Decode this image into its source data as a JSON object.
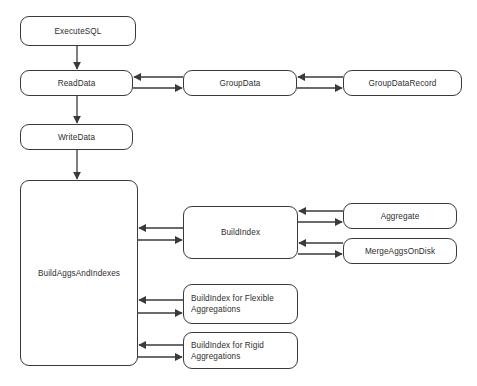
{
  "diagram": {
    "background_color": "#ffffff",
    "stroke_color": "#3a3a3a",
    "text_color": "#2e2e2e",
    "nodes": [
      {
        "id": "execute-sql",
        "label": "ExecuteSQL",
        "x": 20,
        "y": 16,
        "w": 116,
        "h": 30,
        "align": "center"
      },
      {
        "id": "read-data",
        "label": "ReadData",
        "x": 20,
        "y": 70,
        "w": 113,
        "h": 26,
        "align": "center"
      },
      {
        "id": "group-data",
        "label": "GroupData",
        "x": 183,
        "y": 70,
        "w": 114,
        "h": 26,
        "align": "center"
      },
      {
        "id": "group-data-record",
        "label": "GroupDataRecord",
        "x": 343,
        "y": 70,
        "w": 119,
        "h": 26,
        "align": "center"
      },
      {
        "id": "write-data",
        "label": "WriteData",
        "x": 20,
        "y": 124,
        "w": 113,
        "h": 26,
        "align": "center"
      },
      {
        "id": "build-aggs-and-indexes",
        "label": "BuildAggsAndIndexes",
        "x": 20,
        "y": 180,
        "w": 118,
        "h": 186,
        "align": "center"
      },
      {
        "id": "build-index",
        "label": "BuildIndex",
        "x": 183,
        "y": 206,
        "w": 115,
        "h": 53,
        "align": "center"
      },
      {
        "id": "aggregate",
        "label": "Aggregate",
        "x": 343,
        "y": 203,
        "w": 114,
        "h": 26,
        "align": "center"
      },
      {
        "id": "merge-aggs-on-disk",
        "label": "MergeAggsOnDisk",
        "x": 343,
        "y": 238,
        "w": 114,
        "h": 26,
        "align": "center"
      },
      {
        "id": "build-index-flexible",
        "label": "BuildIndex for Flexible\nAggregations",
        "x": 183,
        "y": 284,
        "w": 115,
        "h": 40,
        "align": "left"
      },
      {
        "id": "build-index-rigid",
        "label": "BuildIndex for Rigid\nAggregations",
        "x": 183,
        "y": 332,
        "w": 115,
        "h": 37,
        "align": "left"
      }
    ],
    "connectors": [
      {
        "id": "execute-sql-to-read-data",
        "kind": "vertical-arrow",
        "from": "execute-sql",
        "to": "read-data",
        "x": 77,
        "y1": 46,
        "y2": 70,
        "direction": "down"
      },
      {
        "id": "read-data-to-write-data",
        "kind": "vertical-arrow",
        "from": "read-data",
        "to": "write-data",
        "x": 77,
        "y1": 96,
        "y2": 124,
        "direction": "down"
      },
      {
        "id": "write-data-to-build-aggs",
        "kind": "vertical-arrow",
        "from": "write-data",
        "to": "build-aggs-and-indexes",
        "x": 77,
        "y1": 150,
        "y2": 180,
        "direction": "down"
      },
      {
        "id": "group-data-to-read-data",
        "kind": "horizontal-arrow",
        "from": "group-data",
        "to": "read-data",
        "x1": 183,
        "x2": 133,
        "y": 77,
        "direction": "left"
      },
      {
        "id": "read-data-to-group-data",
        "kind": "horizontal-arrow",
        "from": "read-data",
        "to": "group-data",
        "x1": 133,
        "x2": 183,
        "y": 88,
        "direction": "right"
      },
      {
        "id": "group-data-record-to-group-data",
        "kind": "horizontal-arrow",
        "from": "group-data-record",
        "to": "group-data",
        "x1": 343,
        "x2": 297,
        "y": 77,
        "direction": "left"
      },
      {
        "id": "group-data-to-group-data-record",
        "kind": "horizontal-arrow",
        "from": "group-data",
        "to": "group-data-record",
        "x1": 297,
        "x2": 343,
        "y": 88,
        "direction": "right"
      },
      {
        "id": "build-index-to-build-aggs",
        "kind": "horizontal-arrow",
        "from": "build-index",
        "to": "build-aggs-and-indexes",
        "x1": 183,
        "x2": 138,
        "y": 228,
        "direction": "left"
      },
      {
        "id": "build-aggs-to-build-index",
        "kind": "horizontal-arrow",
        "from": "build-aggs-and-indexes",
        "to": "build-index",
        "x1": 138,
        "x2": 183,
        "y": 240,
        "direction": "right"
      },
      {
        "id": "aggregate-to-build-index",
        "kind": "horizontal-arrow",
        "from": "aggregate",
        "to": "build-index",
        "x1": 343,
        "x2": 298,
        "y": 211,
        "direction": "left"
      },
      {
        "id": "build-index-to-aggregate",
        "kind": "horizontal-arrow",
        "from": "build-index",
        "to": "aggregate",
        "x1": 298,
        "x2": 343,
        "y": 222,
        "direction": "right"
      },
      {
        "id": "merge-aggs-to-build-index",
        "kind": "horizontal-arrow",
        "from": "merge-aggs-on-disk",
        "to": "build-index",
        "x1": 343,
        "x2": 298,
        "y": 243,
        "direction": "left"
      },
      {
        "id": "build-index-to-merge-aggs",
        "kind": "horizontal-arrow",
        "from": "build-index",
        "to": "merge-aggs-on-disk",
        "x1": 298,
        "x2": 343,
        "y": 254,
        "direction": "right"
      },
      {
        "id": "flexible-to-build-aggs",
        "kind": "horizontal-arrow",
        "from": "build-index-flexible",
        "to": "build-aggs-and-indexes",
        "x1": 183,
        "x2": 138,
        "y": 300,
        "direction": "left"
      },
      {
        "id": "build-aggs-to-flexible",
        "kind": "horizontal-arrow",
        "from": "build-aggs-and-indexes",
        "to": "build-index-flexible",
        "x1": 138,
        "x2": 183,
        "y": 313,
        "direction": "right"
      },
      {
        "id": "rigid-to-build-aggs",
        "kind": "horizontal-arrow",
        "from": "build-index-rigid",
        "to": "build-aggs-and-indexes",
        "x1": 183,
        "x2": 138,
        "y": 345,
        "direction": "left"
      },
      {
        "id": "build-aggs-to-rigid",
        "kind": "horizontal-arrow",
        "from": "build-aggs-and-indexes",
        "to": "build-index-rigid",
        "x1": 138,
        "x2": 183,
        "y": 357,
        "direction": "right"
      }
    ]
  }
}
